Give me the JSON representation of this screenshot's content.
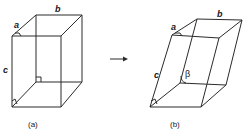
{
  "figure": {
    "colors": {
      "line": "#2a2a2a",
      "text": "#1a1a1a",
      "background": "#ffffff"
    },
    "panel_a": {
      "caption": "(a)",
      "edge_labels": {
        "a": "a",
        "b": "b",
        "c": "c"
      },
      "right_angle_markers": 3
    },
    "arrow": {
      "direction": "right",
      "icon": "arrow-right-icon"
    },
    "panel_b": {
      "caption": "(b)",
      "edge_labels": {
        "a": "a",
        "b": "b",
        "c": "c"
      },
      "angle_label": "β",
      "right_angle_markers": 2
    }
  }
}
